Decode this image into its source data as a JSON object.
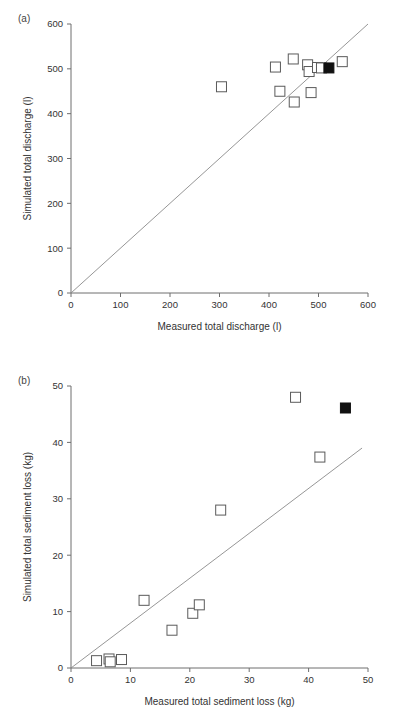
{
  "figure": {
    "background": "#ffffff",
    "marker_open_color": "#ffffff",
    "marker_edge_color": "#5a5a5a",
    "marker_filled_color": "#111111",
    "axis_color": "#6e6e6e",
    "refline_color": "#8a8a8a"
  },
  "panels": [
    {
      "id": "a",
      "label": "(a)",
      "chart_data": {
        "type": "scatter",
        "title": "",
        "xlabel": "Measured total discharge (l)",
        "ylabel": "Simulated total discharge (l)",
        "xlim": [
          0,
          600
        ],
        "ylim": [
          0,
          600
        ],
        "xticks": [
          0,
          100,
          200,
          300,
          400,
          500,
          600
        ],
        "yticks": [
          0,
          100,
          200,
          300,
          400,
          500,
          600
        ],
        "xticklabels": [
          "0",
          "100",
          "200",
          "300",
          "400",
          "500",
          "600"
        ],
        "yticklabels": [
          "0",
          "100",
          "200",
          "300",
          "400",
          "500",
          "600"
        ],
        "grid": false,
        "legend": "none",
        "reference_line": {
          "label": "1:1 line",
          "from": [
            0,
            0
          ],
          "to": [
            600,
            600
          ]
        },
        "series": [
          {
            "name": "Open squares (individual events)",
            "marker": "open-square",
            "points": [
              {
                "x": 304,
                "y": 460
              },
              {
                "x": 413,
                "y": 504
              },
              {
                "x": 422,
                "y": 450
              },
              {
                "x": 449,
                "y": 522
              },
              {
                "x": 451,
                "y": 426
              },
              {
                "x": 478,
                "y": 509
              },
              {
                "x": 481,
                "y": 494
              },
              {
                "x": 485,
                "y": 447
              },
              {
                "x": 498,
                "y": 503
              },
              {
                "x": 506,
                "y": 502
              },
              {
                "x": 548,
                "y": 516
              }
            ]
          },
          {
            "name": "Filled square (mean / total)",
            "marker": "filled-square",
            "points": [
              {
                "x": 521,
                "y": 502
              }
            ]
          }
        ]
      }
    },
    {
      "id": "b",
      "label": "(b)",
      "chart_data": {
        "type": "scatter",
        "title": "",
        "xlabel": "Measured total sediment loss (kg)",
        "ylabel": "Simulated total sediment loss (kg)",
        "xlim": [
          0,
          50
        ],
        "ylim": [
          0,
          50
        ],
        "xticks": [
          0,
          10,
          20,
          30,
          40,
          50
        ],
        "yticks": [
          0,
          10,
          20,
          30,
          40,
          50
        ],
        "xticklabels": [
          "0",
          "10",
          "20",
          "30",
          "40",
          "50"
        ],
        "yticklabels": [
          "0",
          "10",
          "20",
          "30",
          "40",
          "50"
        ],
        "grid": false,
        "legend": "none",
        "reference_line": {
          "label": "1:1 line",
          "from": [
            0,
            0
          ],
          "to": [
            49,
            39
          ]
        },
        "series": [
          {
            "name": "Open squares (individual events)",
            "marker": "open-square",
            "points": [
              {
                "x": 4.3,
                "y": 1.3
              },
              {
                "x": 6.4,
                "y": 1.6
              },
              {
                "x": 6.6,
                "y": 1.1
              },
              {
                "x": 8.5,
                "y": 1.5
              },
              {
                "x": 12.3,
                "y": 12.0
              },
              {
                "x": 17.0,
                "y": 6.7
              },
              {
                "x": 20.5,
                "y": 9.7
              },
              {
                "x": 21.6,
                "y": 11.2
              },
              {
                "x": 25.2,
                "y": 28.0
              },
              {
                "x": 37.8,
                "y": 48.0
              },
              {
                "x": 41.9,
                "y": 37.4
              }
            ]
          },
          {
            "name": "Filled square (mean / total)",
            "marker": "filled-square",
            "points": [
              {
                "x": 46.2,
                "y": 46.1
              }
            ]
          }
        ]
      }
    }
  ]
}
